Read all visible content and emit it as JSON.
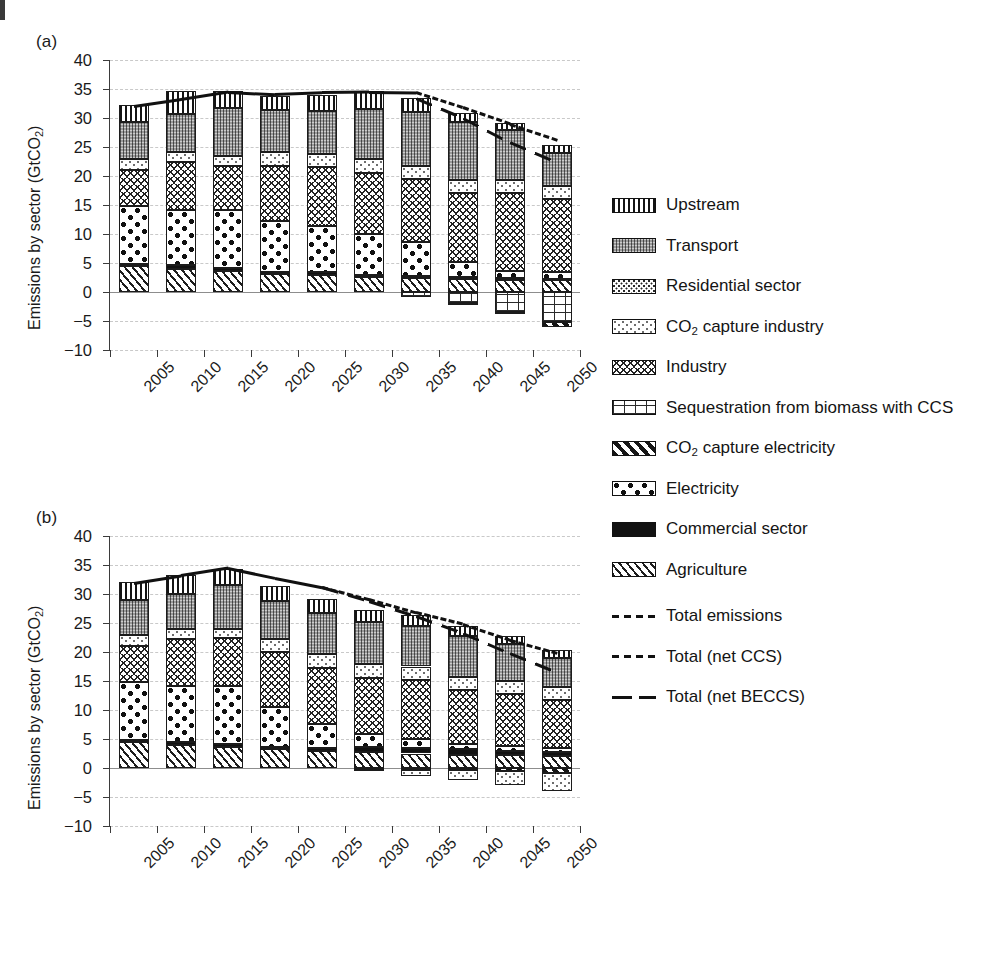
{
  "figure": {
    "ylabel": "Emissions by sector (GtCO",
    "ylabel_sub": "2",
    "ylabel_close": ")",
    "panel_a_tag": "(a)",
    "panel_b_tag": "(b)"
  },
  "legend": {
    "items": [
      {
        "key": "upstream",
        "label": "Upstream",
        "swatch": "p-upstream"
      },
      {
        "key": "transport",
        "label": "Transport",
        "swatch": "p-transport"
      },
      {
        "key": "residential",
        "label": "Residential sector",
        "swatch": "p-residential"
      },
      {
        "key": "co2_industry",
        "label_pre": "CO",
        "label_sub": "2",
        "label_post": " capture industry",
        "swatch": "p-co2ind"
      },
      {
        "key": "industry",
        "label": "Industry",
        "swatch": "p-industry"
      },
      {
        "key": "beccs",
        "label": "Sequestration from biomass with CCS",
        "swatch": "p-beccs"
      },
      {
        "key": "co2_elec",
        "label_pre": "CO",
        "label_sub": "2",
        "label_post": " capture electricity",
        "swatch": "p-co2elec"
      },
      {
        "key": "electricity",
        "label": "Electricity",
        "swatch": "p-electricity"
      },
      {
        "key": "commercial",
        "label": "Commercial sector",
        "swatch": "p-commercial"
      },
      {
        "key": "agriculture",
        "label": "Agriculture",
        "swatch": "p-agriculture"
      }
    ],
    "lines": [
      {
        "key": "total_emissions",
        "label": "Total emissions",
        "style": "dashed"
      },
      {
        "key": "total_net_ccs",
        "label": "Total (net CCS)",
        "style": "dashed"
      },
      {
        "key": "total_net_beccs",
        "label": "Total (net BECCS)",
        "style": "longdash"
      }
    ]
  },
  "chart_data": [
    {
      "id": "panel-a",
      "type": "bar",
      "stacked": true,
      "title": "(a)",
      "xlabel": "",
      "ylabel": "Emissions by sector (GtCO2)",
      "ylim": [
        -10,
        40
      ],
      "yticks": [
        -10,
        -5,
        0,
        5,
        10,
        15,
        20,
        25,
        30,
        35,
        40
      ],
      "ytick_labels": [
        "−10",
        "−5",
        "0",
        "5",
        "10",
        "15",
        "20",
        "25",
        "30",
        "35",
        "40"
      ],
      "grid": true,
      "categories": [
        "2005",
        "2010",
        "2015",
        "2020",
        "2025",
        "2030",
        "2035",
        "2040",
        "2045",
        "2050"
      ],
      "series": [
        {
          "name": "Agriculture",
          "key": "agriculture",
          "values": [
            4.4,
            4.0,
            3.6,
            3.1,
            2.9,
            2.6,
            2.4,
            2.2,
            2.1,
            2.0
          ]
        },
        {
          "name": "Commercial sector",
          "key": "commercial",
          "values": [
            0.5,
            0.6,
            0.5,
            0.4,
            0.5,
            0.4,
            0.4,
            0.4,
            0.3,
            0.3
          ]
        },
        {
          "name": "Electricity",
          "key": "electricity",
          "values": [
            9.9,
            9.5,
            10.1,
            8.7,
            7.9,
            7.0,
            5.9,
            2.6,
            1.3,
            1.1
          ]
        },
        {
          "name": "Industry",
          "key": "industry",
          "values": [
            6.2,
            8.3,
            7.6,
            9.6,
            10.2,
            10.6,
            10.7,
            11.8,
            13.4,
            12.7
          ]
        },
        {
          "name": "CO2 capture industry",
          "key": "co2_industry",
          "values": [
            1.9,
            1.7,
            1.6,
            2.3,
            2.3,
            2.4,
            2.4,
            2.3,
            2.2,
            2.1
          ]
        },
        {
          "name": "Residential sector",
          "key": "residential",
          "values": [
            0.0,
            0.0,
            0.0,
            0.0,
            0.0,
            0.0,
            0.0,
            0.0,
            0.0,
            0.0
          ]
        },
        {
          "name": "Transport",
          "key": "transport",
          "values": [
            6.4,
            6.6,
            8.3,
            7.2,
            7.4,
            8.5,
            9.3,
            10.0,
            8.6,
            5.8
          ]
        },
        {
          "name": "Upstream",
          "key": "upstream",
          "values": [
            2.9,
            4.0,
            2.9,
            2.5,
            2.8,
            3.1,
            2.4,
            1.5,
            1.3,
            1.3
          ]
        },
        {
          "name": "Sequestration from biomass with CCS",
          "key": "beccs",
          "values": [
            0.0,
            0.0,
            0.0,
            0.0,
            0.0,
            0.0,
            -0.8,
            -1.9,
            -3.5,
            -5.2
          ]
        },
        {
          "name": "CO2 capture electricity",
          "key": "co2_elec",
          "values": [
            0.0,
            0.0,
            0.0,
            0.0,
            0.0,
            0.0,
            0.0,
            -0.1,
            -0.2,
            -0.8
          ]
        }
      ],
      "lines": [
        {
          "name": "Total emissions",
          "key": "total_emissions",
          "style": "solidish",
          "values": [
            32.2,
            33.4,
            34.7,
            34.3,
            34.6,
            34.7,
            34.6,
            null,
            null,
            null
          ]
        },
        {
          "name": "Total (net CCS)",
          "key": "total_net_ccs",
          "style": "dashed",
          "values": [
            null,
            null,
            null,
            null,
            null,
            null,
            34.6,
            32.0,
            29.2,
            26.5
          ]
        },
        {
          "name": "Total (net BECCS)",
          "key": "total_net_beccs",
          "style": "longdash",
          "values": [
            null,
            null,
            null,
            null,
            null,
            null,
            33.6,
            30.2,
            26.0,
            22.5
          ]
        }
      ]
    },
    {
      "id": "panel-b",
      "type": "bar",
      "stacked": true,
      "title": "(b)",
      "xlabel": "",
      "ylabel": "Emissions by sector (GtCO2)",
      "ylim": [
        -10,
        40
      ],
      "yticks": [
        -10,
        -5,
        0,
        5,
        10,
        15,
        20,
        25,
        30,
        35,
        40
      ],
      "ytick_labels": [
        "−10",
        "−5",
        "0",
        "5",
        "10",
        "15",
        "20",
        "25",
        "30",
        "35",
        "40"
      ],
      "grid": true,
      "categories": [
        "2005",
        "2010",
        "2015",
        "2020",
        "2025",
        "2030",
        "2035",
        "2040",
        "2045",
        "2050"
      ],
      "series": [
        {
          "name": "Agriculture",
          "key": "agriculture",
          "values": [
            4.4,
            4.0,
            3.6,
            3.2,
            2.9,
            2.7,
            2.5,
            2.3,
            2.2,
            2.1
          ]
        },
        {
          "name": "Commercial sector",
          "key": "commercial",
          "values": [
            0.5,
            0.5,
            0.5,
            0.5,
            0.5,
            0.9,
            1.0,
            0.9,
            0.8,
            0.6
          ]
        },
        {
          "name": "Electricity",
          "key": "electricity",
          "values": [
            9.9,
            9.6,
            10.0,
            6.8,
            4.2,
            2.3,
            1.5,
            1.0,
            0.8,
            0.8
          ]
        },
        {
          "name": "Industry",
          "key": "industry",
          "values": [
            6.3,
            8.1,
            8.3,
            9.5,
            9.7,
            9.6,
            10.2,
            9.2,
            9.0,
            8.2
          ]
        },
        {
          "name": "CO2 capture industry",
          "key": "co2_industry",
          "values": [
            1.8,
            1.7,
            1.6,
            2.3,
            2.4,
            2.4,
            2.3,
            2.3,
            2.2,
            2.2
          ]
        },
        {
          "name": "Residential sector",
          "key": "residential",
          "values": [
            0.0,
            0.0,
            0.0,
            0.0,
            0.0,
            0.0,
            0.0,
            0.0,
            0.0,
            0.0
          ]
        },
        {
          "name": "Transport",
          "key": "transport",
          "values": [
            6.1,
            6.1,
            7.5,
            6.5,
            7.1,
            7.3,
            6.9,
            7.0,
            6.3,
            5.1
          ]
        },
        {
          "name": "Upstream",
          "key": "upstream",
          "values": [
            3.1,
            3.3,
            2.8,
            2.6,
            2.3,
            2.0,
            1.9,
            1.7,
            1.5,
            1.3
          ]
        },
        {
          "name": "CO2 capture electricity",
          "key": "co2_elec",
          "values": [
            0.0,
            0.0,
            0.0,
            0.0,
            0.0,
            -0.1,
            -0.3,
            -0.4,
            -0.5,
            -0.8
          ]
        },
        {
          "name": "CO2 capture industry (stored)",
          "key": "co2_industry",
          "values": [
            0.0,
            0.0,
            0.0,
            0.0,
            0.0,
            -0.4,
            -1.1,
            -1.7,
            -2.4,
            -3.2
          ]
        }
      ],
      "lines": [
        {
          "name": "Total emissions",
          "key": "total_emissions",
          "style": "solidish",
          "values": [
            32.1,
            33.4,
            34.7,
            33.0,
            31.4,
            null,
            null,
            null,
            null,
            null
          ]
        },
        {
          "name": "Total (net CCS)",
          "key": "total_net_ccs",
          "style": "dashed",
          "values": [
            null,
            null,
            null,
            null,
            31.4,
            29.3,
            27.0,
            25.0,
            22.3,
            20.1
          ]
        },
        {
          "name": "Total (net BECCS)",
          "key": "total_net_beccs",
          "style": "longdash",
          "values": [
            null,
            null,
            null,
            null,
            31.4,
            29.0,
            26.4,
            23.5,
            20.0,
            16.7
          ]
        }
      ]
    }
  ]
}
